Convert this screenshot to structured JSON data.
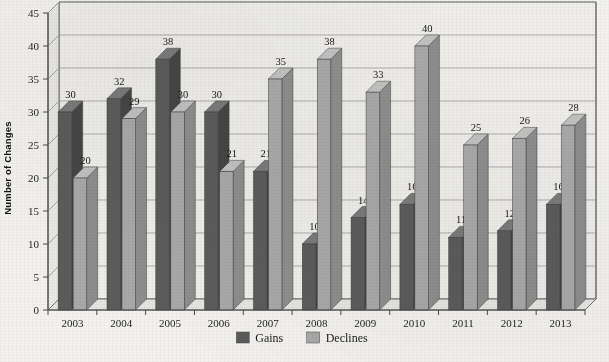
{
  "chart_data": {
    "type": "bar",
    "title": "",
    "xlabel": "",
    "ylabel": "Number of Changes",
    "ylim": [
      0,
      45
    ],
    "ytick_step": 5,
    "yticks": [
      "0",
      "5",
      "10",
      "15",
      "20",
      "25",
      "30",
      "35",
      "40",
      "45"
    ],
    "grid": true,
    "legend_position": "bottom-center",
    "style": "3d-column",
    "categories": [
      "2003",
      "2004",
      "2005",
      "2006",
      "2007",
      "2008",
      "2009",
      "2010",
      "2011",
      "2012",
      "2013"
    ],
    "series": [
      {
        "name": "Gains",
        "color": "#5c5c5c",
        "values": [
          30,
          32,
          38,
          30,
          21,
          10,
          14,
          16,
          11,
          12,
          16
        ]
      },
      {
        "name": "Declines",
        "color": "#a9a9a9",
        "values": [
          20,
          29,
          30,
          21,
          35,
          38,
          33,
          40,
          25,
          26,
          28
        ]
      }
    ]
  },
  "legend": {
    "items": [
      {
        "label": "Gains",
        "swatch": "#5c5c5c"
      },
      {
        "label": "Declines",
        "swatch": "#a9a9a9"
      }
    ]
  },
  "axes": {
    "y_title": "Number of Changes"
  },
  "colors": {
    "gains": "#5c5c5c",
    "gains_top": "#7b7b7b",
    "gains_side": "#464646",
    "declines": "#a9a9a9",
    "declines_top": "#c2c2c2",
    "declines_side": "#8e8e8e",
    "wall": "#efeeea",
    "floor": "#e6e5e1",
    "grid": "#9a9a96",
    "frame": "#6f6f6c",
    "page": "#f3f2ee"
  }
}
